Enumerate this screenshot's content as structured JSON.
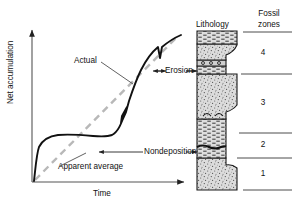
{
  "figure": {
    "type": "geology-stratigraphic-accumulation-diagram",
    "axes": {
      "y_label": "Net accumulation",
      "x_label": "Time"
    },
    "curve_labels": {
      "actual": "Actual",
      "apparent_average": "Apparent average",
      "erosion": "Erosion",
      "nondeposition": "Nondeposition"
    },
    "columns": {
      "lithology_header": "Lithology",
      "fossil_zones_header_line1": "Fossil",
      "fossil_zones_header_line2": "zones"
    },
    "fossil_zones": [
      {
        "label": "4"
      },
      {
        "label": "3"
      },
      {
        "label": "2"
      },
      {
        "label": "1"
      }
    ],
    "colors": {
      "actual_curve": "#111111",
      "apparent_average": "#b3b3b3",
      "axis": "#555555",
      "rock_fill": "#d8d8d8",
      "rock_outline": "#1a1a1a",
      "zone_rule": "#4d4d4d"
    }
  }
}
